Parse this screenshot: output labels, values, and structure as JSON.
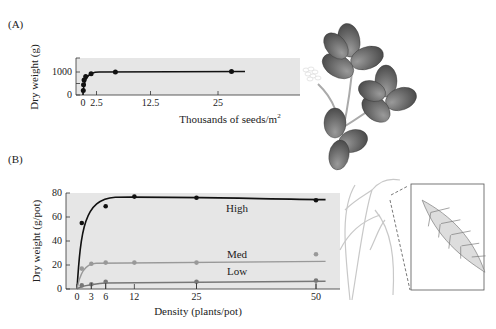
{
  "panels": {
    "a_label": "(A)",
    "b_label": "(B)"
  },
  "chart_data": [
    {
      "id": "A",
      "type": "line",
      "title": "",
      "xlabel": "Thousands of seeds/m",
      "xlabel_sup": "2",
      "ylabel": "Dry weight (g)",
      "xticks": [
        0,
        2.5,
        12.5,
        25
      ],
      "xtick_labels": [
        "0",
        "2.5",
        "12.5",
        "25"
      ],
      "yticks": [
        0,
        1000
      ],
      "ytick_labels": [
        "0",
        "1000"
      ],
      "xlim": [
        -0.3,
        31
      ],
      "ylim": [
        0,
        1500
      ],
      "grid": false,
      "series": [
        {
          "name": "Trifolium",
          "color": "#111111",
          "x": [
            0.05,
            0.1,
            0.2,
            0.5,
            1.5,
            6,
            27.5
          ],
          "y": [
            200,
            450,
            650,
            800,
            920,
            1000,
            1020
          ]
        }
      ]
    },
    {
      "id": "B",
      "type": "line",
      "title": "",
      "xlabel": "Density (plants/pot)",
      "ylabel": "Dry weight (g/pot)",
      "xticks": [
        0,
        3,
        6,
        12,
        25,
        50
      ],
      "xtick_labels": [
        "0",
        "3",
        "6",
        "12",
        "25",
        "50"
      ],
      "yticks": [
        0,
        20,
        40,
        60,
        80
      ],
      "ytick_labels": [
        "0",
        "20",
        "40",
        "60",
        "80"
      ],
      "xlim": [
        -1,
        54
      ],
      "ylim": [
        0,
        80
      ],
      "grid": false,
      "series": [
        {
          "name": "High",
          "color": "#111111",
          "x": [
            1,
            6,
            12,
            25,
            50
          ],
          "y": [
            55,
            69,
            77,
            76,
            74
          ]
        },
        {
          "name": "Med",
          "color": "#999999",
          "x": [
            1,
            3,
            6,
            12,
            25,
            50
          ],
          "y": [
            17,
            21,
            22,
            22,
            22,
            29
          ]
        },
        {
          "name": "Low",
          "color": "#777777",
          "x": [
            1,
            3,
            6,
            25,
            50
          ],
          "y": [
            3,
            4,
            6,
            6,
            7
          ]
        }
      ],
      "annotations": [
        "High",
        "Med",
        "Low"
      ]
    }
  ],
  "illustrations": {
    "a": "clover-plant",
    "b": "grass-plant-with-spikelet-inset"
  }
}
